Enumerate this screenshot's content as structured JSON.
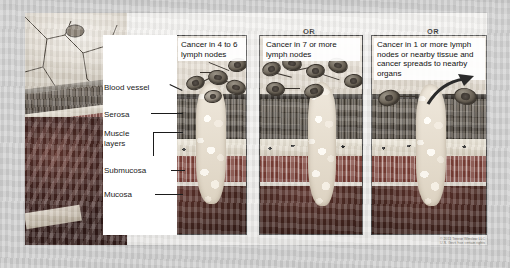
{
  "figure": {
    "connectors": [
      {
        "name": "or-1",
        "label": "OR"
      },
      {
        "name": "or-2",
        "label": "OR"
      }
    ],
    "credit": {
      "line1": "© 2011 Terese Winslow LLC",
      "line2": "U.S. Govt. has certain rights"
    }
  },
  "anatomy_labels": [
    {
      "key": "blood_vessel",
      "label": "Blood vessel"
    },
    {
      "key": "serosa",
      "label": "Serosa"
    },
    {
      "key": "muscle",
      "label": "Muscle\nlayers"
    },
    {
      "key": "muscle_line1",
      "label": "Muscle"
    },
    {
      "key": "muscle_line2",
      "label": "layers"
    },
    {
      "key": "submucosa",
      "label": "Submucosa"
    },
    {
      "key": "mucosa",
      "label": "Mucosa"
    }
  ],
  "panels": [
    {
      "id": "panel-1",
      "caption": "Cancer in 4 to 6 lymph nodes",
      "stage": "IIIA–IIIB",
      "cancer_nodes": 5,
      "total_nodes": 6,
      "spread_to_organs": false
    },
    {
      "id": "panel-2",
      "caption": "Cancer in 7 or more lymph nodes",
      "stage": "IIIC",
      "cancer_nodes": 7,
      "total_nodes": 7,
      "spread_to_organs": false
    },
    {
      "id": "panel-3",
      "caption": "Cancer in 1 or more lymph nodes or nearby tissue and cancer spreads to nearby organs",
      "stage": "IIIC",
      "cancer_nodes": 2,
      "total_nodes": 2,
      "spread_to_organs": true
    }
  ],
  "wall_layers": [
    "Serosa",
    "Muscle layers",
    "Submucosa",
    "Mucosa"
  ],
  "colors": {
    "page_background": "#cdcdcd",
    "plate_background": "#f1f0ee",
    "panel_border": "#4a4a4a",
    "caption_background": "#ffffff",
    "text": "#111111",
    "serosa": "#2e2a26",
    "muscle": "#5a5147",
    "submucosa": "#e4ddcf",
    "mucosa": "#7e463c",
    "lumen": "#3a201b",
    "tumor": "#f3ece1",
    "lymph_node": "#6d6559",
    "credit_text": "#6e6a64"
  }
}
